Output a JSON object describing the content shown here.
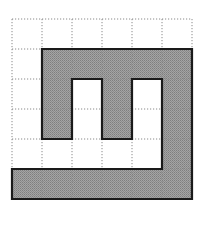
{
  "figure": {
    "grid": {
      "rows": 6,
      "cols": 6,
      "origin_x": 12,
      "origin_y": 19,
      "cell_size": 30,
      "line_style": "dotted",
      "line_color": "#8a8a8a"
    },
    "shape": {
      "fill_color": "#9a9a9a",
      "stroke_color": "#1a1a1a",
      "stroke_width": 2.2,
      "filled_cells": [
        [
          1,
          1
        ],
        [
          1,
          2
        ],
        [
          1,
          3
        ],
        [
          1,
          4
        ],
        [
          1,
          5
        ],
        [
          2,
          1
        ],
        [
          2,
          3
        ],
        [
          2,
          5
        ],
        [
          3,
          1
        ],
        [
          3,
          3
        ],
        [
          3,
          5
        ],
        [
          4,
          5
        ],
        [
          5,
          0
        ],
        [
          5,
          1
        ],
        [
          5,
          2
        ],
        [
          5,
          3
        ],
        [
          5,
          4
        ],
        [
          5,
          5
        ]
      ],
      "outline": [
        [
          1,
          1
        ],
        [
          6,
          1
        ],
        [
          6,
          6
        ],
        [
          0,
          6
        ],
        [
          0,
          5
        ],
        [
          5,
          5
        ],
        [
          5,
          2
        ],
        [
          4,
          2
        ],
        [
          4,
          4
        ],
        [
          3,
          4
        ],
        [
          3,
          2
        ],
        [
          2,
          2
        ],
        [
          2,
          4
        ],
        [
          1,
          4
        ],
        [
          1,
          1
        ]
      ]
    }
  }
}
